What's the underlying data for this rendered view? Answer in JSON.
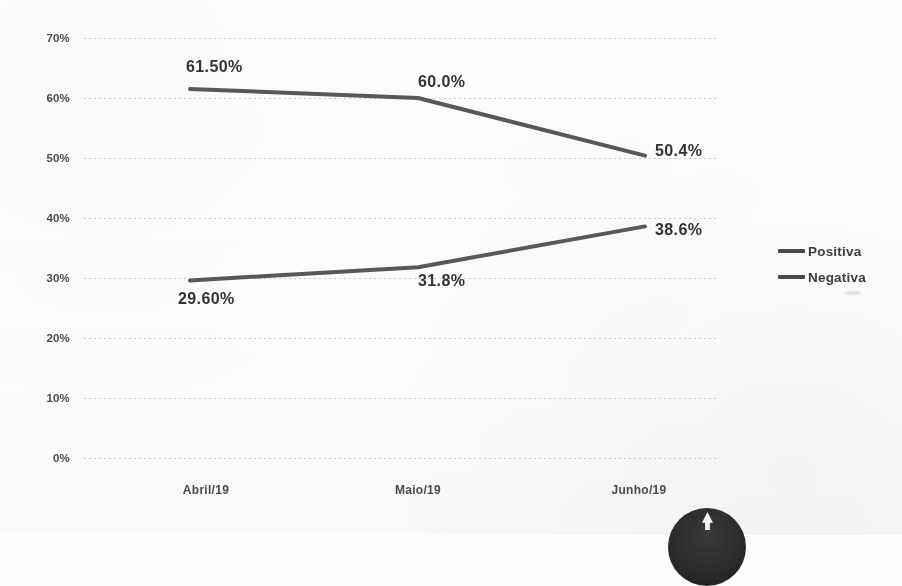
{
  "chart_data": {
    "type": "line",
    "title": "",
    "xlabel": "",
    "ylabel": "",
    "categories": [
      "Abril/19",
      "Maio/19",
      "Junho/19"
    ],
    "ylim": [
      0,
      70
    ],
    "ytick_labels": [
      "70%",
      "60%",
      "50%",
      "40%",
      "30%",
      "20%",
      "10%",
      "0%"
    ],
    "ytick_values": [
      70,
      60,
      50,
      40,
      30,
      20,
      10,
      0
    ],
    "grid": true,
    "legend_position": "right",
    "series": [
      {
        "name": "Positiva",
        "color": "#4a4a4a",
        "values": [
          61.5,
          60.0,
          50.4
        ],
        "point_labels": [
          "61.50%",
          "60.0%",
          "50.4%"
        ]
      },
      {
        "name": "Negativa",
        "color": "#4a4a4a",
        "values": [
          29.6,
          31.8,
          38.6
        ],
        "point_labels": [
          "29.60%",
          "31.8%",
          "38.6%"
        ]
      }
    ]
  },
  "legend": {
    "items": [
      {
        "label": "Positiva"
      },
      {
        "label": "Negativa"
      }
    ]
  },
  "axes": {
    "y_ticks": [
      {
        "label": "70%"
      },
      {
        "label": "60%"
      },
      {
        "label": "50%"
      },
      {
        "label": "40%"
      },
      {
        "label": "30%"
      },
      {
        "label": "20%"
      },
      {
        "label": "10%"
      },
      {
        "label": "0%"
      }
    ],
    "x_ticks": [
      {
        "label": "Abril/19"
      },
      {
        "label": "Maio/19"
      },
      {
        "label": "Junho/19"
      }
    ]
  },
  "data_labels": {
    "positiva": [
      {
        "text": "61.50%"
      },
      {
        "text": "60.0%"
      },
      {
        "text": "50.4%"
      }
    ],
    "negativa": [
      {
        "text": "29.60%"
      },
      {
        "text": "31.8%"
      },
      {
        "text": "38.6%"
      }
    ]
  },
  "header": {
    "clipped_title": ""
  }
}
